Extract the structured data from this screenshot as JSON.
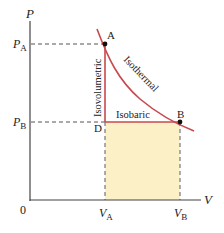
{
  "axes": {
    "y_label": "P",
    "x_label": "V",
    "origin_label": "0"
  },
  "ticks": {
    "pa": {
      "main": "P",
      "sub": "A"
    },
    "pb": {
      "main": "P",
      "sub": "B"
    },
    "va": {
      "main": "V",
      "sub": "A"
    },
    "vb": {
      "main": "V",
      "sub": "B"
    }
  },
  "points": {
    "a": "A",
    "b": "B",
    "d": "D"
  },
  "processes": {
    "isovolumetric": "Isovolumetric",
    "isothermal": "Isothermal",
    "isobaric": "Isobaric"
  },
  "colors": {
    "process_line": "#C9484E",
    "fill": "#FBF0C6",
    "axis": "#444444",
    "dashed": "#555555"
  }
}
